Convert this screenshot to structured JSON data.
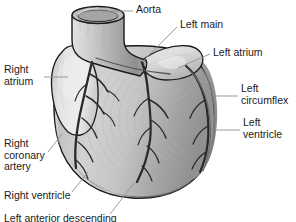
{
  "figure": {
    "background_color": "#ffffff",
    "outline_color": "#1a1a1a",
    "leader_line_color": "#8a8a8a",
    "palette": {
      "aorta_light": "#d8d8d8",
      "aorta_mid": "#b4b4b4",
      "aorta_dark": "#8e8e8e",
      "atrium_light": "#e0e0e0",
      "ventricle_light": "#cacaca",
      "ventricle_mid": "#a8a8a8",
      "ventricle_dark": "#8c8c8c",
      "shadow": "#6e6e6e",
      "vessel": "#2a2a2a"
    }
  },
  "labels": [
    {
      "id": "aorta",
      "text": "Aorta",
      "x": 136,
      "y": 5,
      "leader": {
        "x1": 133,
        "y1": 11,
        "x2": 112,
        "y2": 11
      }
    },
    {
      "id": "left-main",
      "text": "Left main",
      "x": 180,
      "y": 20,
      "leader": {
        "x1": 177,
        "y1": 27,
        "x2": 142,
        "y2": 62
      }
    },
    {
      "id": "left-atrium",
      "text": "Left atrium",
      "x": 213,
      "y": 48,
      "leader": {
        "x1": 210,
        "y1": 54,
        "x2": 178,
        "y2": 68
      }
    },
    {
      "id": "right-atrium",
      "text": "Right\natrium",
      "x": 4,
      "y": 65,
      "leader": {
        "x1": 44,
        "y1": 77,
        "x2": 68,
        "y2": 77
      }
    },
    {
      "id": "left-circumflex",
      "text": "Left\ncircumflex",
      "x": 241,
      "y": 84,
      "leader": {
        "x1": 238,
        "y1": 96,
        "x2": 215,
        "y2": 96
      }
    },
    {
      "id": "left-ventricle",
      "text": "Left\nventricle",
      "x": 243,
      "y": 118,
      "leader": {
        "x1": 240,
        "y1": 130,
        "x2": 213,
        "y2": 130
      }
    },
    {
      "id": "right-coronary-artery",
      "text": "Right\ncoronary\nartery",
      "x": 4,
      "y": 139,
      "leader": {
        "x1": 48,
        "y1": 152,
        "x2": 62,
        "y2": 134
      }
    },
    {
      "id": "right-ventricle",
      "text": "Right ventricle",
      "x": 4,
      "y": 191,
      "leader": {
        "x1": 72,
        "y1": 192,
        "x2": 88,
        "y2": 172
      }
    },
    {
      "id": "left-anterior-descending",
      "text": "Left anterior descending",
      "x": 4,
      "y": 214,
      "leader": {
        "x1": 110,
        "y1": 214,
        "x2": 135,
        "y2": 182
      }
    }
  ]
}
